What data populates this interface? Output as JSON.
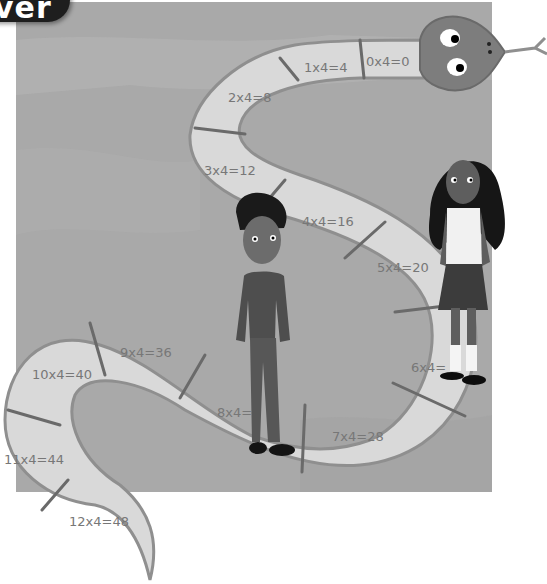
{
  "header": {
    "tab_label": "ver"
  },
  "illustration": {
    "description": "Snake-shaped number path showing the 4 times table with two children standing on it",
    "colors": {
      "background": "#ffffff",
      "scene": "#a9a9a9",
      "scene_light": "#b6b6b6",
      "path_fill": "#d9d9d9",
      "path_edge": "#8f8f8f",
      "divider": "#6a6a6a",
      "label": "#777777",
      "snake_head": "#7d7d7d",
      "header_tab": "#1e1e1e"
    },
    "snake_segments": [
      {
        "label": "0x4=0"
      },
      {
        "label": "1x4=4"
      },
      {
        "label": "2x4=8"
      },
      {
        "label": "3x4=12"
      },
      {
        "label": "4x4=16"
      },
      {
        "label": "5x4=20"
      },
      {
        "label": "6x4="
      },
      {
        "label": "7x4=28"
      },
      {
        "label": "8x4="
      },
      {
        "label": "9x4=36"
      },
      {
        "label": "10x4=40"
      },
      {
        "label": "11x4=44"
      },
      {
        "label": "12x4=48"
      }
    ],
    "characters": [
      {
        "name": "boy",
        "outfit": "dark sweater, dark trousers, white collar"
      },
      {
        "name": "girl",
        "outfit": "white blouse, dark skirt, white socks, black shoes"
      }
    ]
  }
}
